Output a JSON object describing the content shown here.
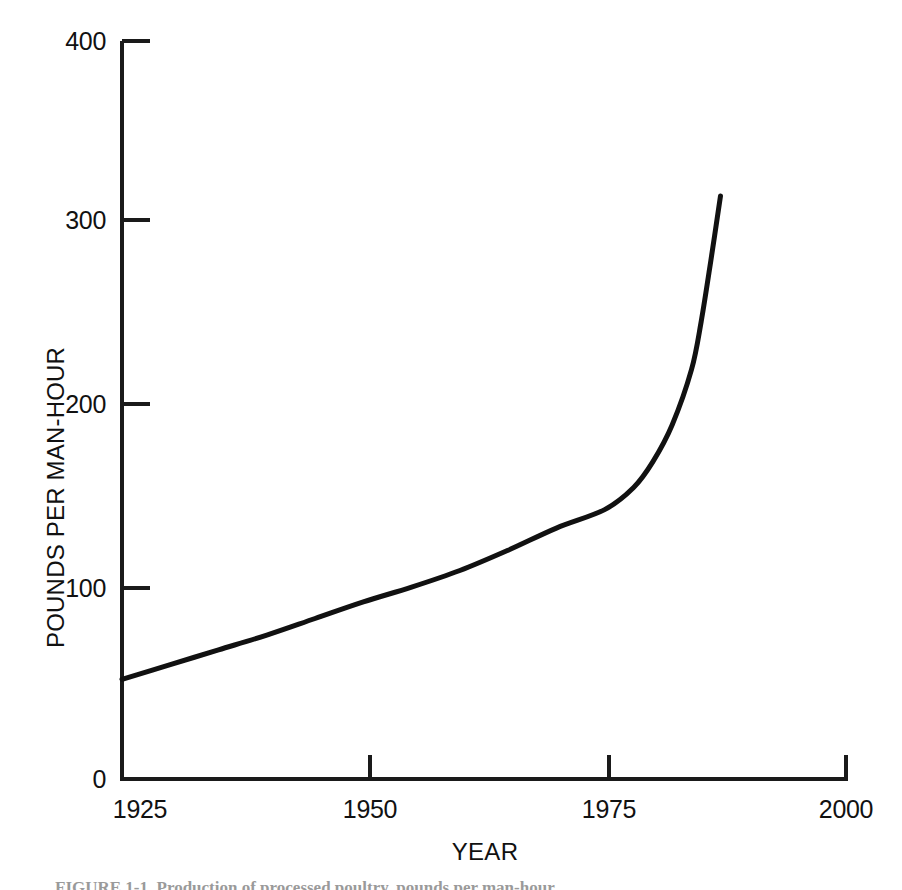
{
  "chart_data": {
    "type": "line",
    "title": "",
    "subtitle": "",
    "xlabel": "YEAR",
    "ylabel": "POUNDS PER MAN-HOUR",
    "xlim": [
      1925,
      2000
    ],
    "ylim": [
      0,
      400
    ],
    "xticks": [
      1925,
      1950,
      1975,
      2000
    ],
    "xtick_labels": [
      "1925",
      "1950",
      "1975",
      "2000"
    ],
    "yticks": [
      0,
      100,
      200,
      300,
      400
    ],
    "ytick_labels": [
      "0",
      "100",
      "200",
      "300",
      "400"
    ],
    "grid": false,
    "legend": null,
    "line_color": "#111111",
    "line_width": 5,
    "series": [
      {
        "name": "Productivity",
        "x": [
          1925,
          1930,
          1935,
          1940,
          1945,
          1950,
          1955,
          1960,
          1965,
          1970,
          1975,
          1978,
          1980,
          1982,
          1984,
          1985,
          1986,
          1987
        ],
        "y": [
          54,
          62,
          70,
          78,
          87,
          96,
          104,
          113,
          124,
          136,
          146,
          158,
          172,
          192,
          222,
          248,
          281,
          316
        ]
      }
    ],
    "annotations": []
  },
  "axes": {
    "y_title": "POUNDS PER MAN-HOUR",
    "x_title": "YEAR",
    "y_tick_labels": [
      "400",
      "300",
      "200",
      "100",
      "0"
    ],
    "x_tick_labels": [
      "1925",
      "1950",
      "1975",
      "2000"
    ]
  },
  "caption": {
    "text": "FIGURE 1-1.  Production of processed poultry, pounds per man-hour."
  },
  "colors": {
    "background": "#ffffff",
    "ink": "#111111",
    "axis": "#1a1a1a",
    "caption": "#9a9a9a"
  }
}
